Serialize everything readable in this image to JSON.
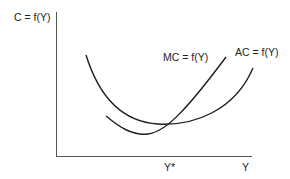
{
  "diagram": {
    "type": "cost-curves",
    "y_axis_label": "C = f(Y)",
    "x_axis_label": "Y",
    "x_marker_label": "Y*",
    "curves": [
      {
        "name": "MC",
        "label": "MC = f(Y)"
      },
      {
        "name": "AC",
        "label": "AC = f(Y)"
      }
    ],
    "colors": {
      "line": "#1e1e1e",
      "axis": "#555555",
      "background": "#ffffff"
    }
  }
}
